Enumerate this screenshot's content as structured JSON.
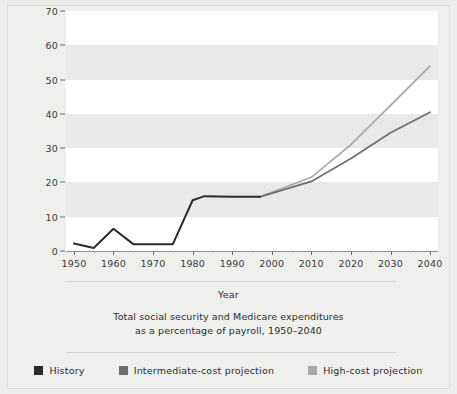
{
  "chart_data": {
    "type": "line",
    "title": "",
    "caption_line1": "Total social security and Medicare expenditures",
    "caption_line2": "as a percentage of payroll, 1950–2040",
    "xlabel": "Year",
    "ylabel": "Percentage of Taxable Payroll",
    "xlim": [
      1948,
      2042
    ],
    "ylim": [
      0,
      70
    ],
    "yticks": [
      0,
      10,
      20,
      30,
      40,
      50,
      60,
      70
    ],
    "xticks": [
      1950,
      1960,
      1970,
      1980,
      1990,
      2000,
      2010,
      2020,
      2030,
      2040
    ],
    "grid": "alternating-horizontal-bands",
    "legend_position": "bottom",
    "series": [
      {
        "name": "History",
        "color": "#2b2b2b",
        "x": [
          1950,
          1955,
          1960,
          1965,
          1970,
          1975,
          1980,
          1983,
          1990,
          1997
        ],
        "values": [
          2.2,
          0.9,
          6.5,
          2.0,
          2.0,
          2.0,
          14.8,
          16.0,
          15.8,
          15.8
        ]
      },
      {
        "name": "Intermediate-cost projection",
        "color": "#6e6e6e",
        "x": [
          1997,
          2010,
          2020,
          2030,
          2040
        ],
        "values": [
          15.8,
          20.3,
          27.0,
          34.5,
          40.5
        ]
      },
      {
        "name": "High-cost projection",
        "color": "#a8a8a8",
        "x": [
          1997,
          2010,
          2020,
          2030,
          2040
        ],
        "values": [
          15.8,
          21.5,
          31.0,
          42.5,
          54.0
        ]
      }
    ]
  },
  "legend": {
    "items": [
      {
        "label": "History",
        "color": "#2b2b2b"
      },
      {
        "label": "Intermediate-cost projection",
        "color": "#6e6e6e"
      },
      {
        "label": "High-cost projection",
        "color": "#a8a8a8"
      }
    ]
  }
}
